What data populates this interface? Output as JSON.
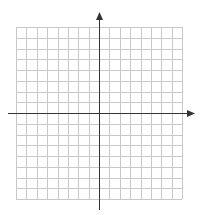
{
  "chart_data": {
    "type": "coordinate-grid",
    "title": "",
    "xlabel": "",
    "ylabel": "",
    "xlim": [
      -8,
      8
    ],
    "ylim": [
      -8,
      8
    ],
    "grid": true,
    "grid_columns": 16,
    "grid_rows": 16,
    "tick_labels": [],
    "series": [],
    "axes_arrows": [
      "positive-x",
      "positive-y"
    ]
  },
  "colors": {
    "background": "#ffffff",
    "grid_line": "#c8c8c8",
    "axis_line": "#333333"
  },
  "layout": {
    "grid_left": 16,
    "grid_top": 27,
    "grid_right": 182,
    "grid_bottom": 199,
    "x_axis_y": 113,
    "y_axis_x": 99,
    "x_axis_start": 8,
    "x_axis_end": 195,
    "y_axis_start": 210,
    "y_axis_end": 12
  }
}
